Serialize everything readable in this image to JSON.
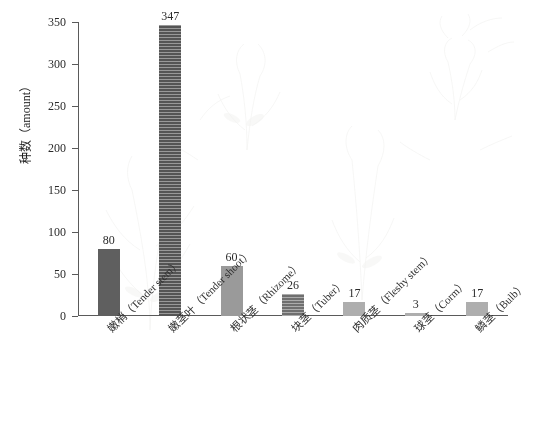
{
  "chart_data": {
    "type": "bar",
    "title": "",
    "subtitle": "",
    "xlabel": "",
    "ylabel": "种数（amount）",
    "ylim": [
      0,
      350
    ],
    "yticks": [
      0,
      50,
      100,
      150,
      200,
      250,
      300,
      350
    ],
    "grid": false,
    "legend": "none",
    "categories": [
      "嫩梢（Tender stem）",
      "嫩茎叶（Tender shoot）",
      "根状茎（Rhizome）",
      "块茎（Tuber）",
      "肉质茎（Fleshy stem）",
      "球茎（Corm）",
      "鳞茎（Bulb）"
    ],
    "values": [
      80,
      347,
      60,
      26,
      17,
      3,
      17
    ],
    "data_labels": [
      "80",
      "347",
      "60",
      "26",
      "17",
      "3",
      "17"
    ],
    "bar_styles": [
      "solid-dark",
      "hatch-dark",
      "solid-mid",
      "hatch-mid",
      "solid-light",
      "solid-light",
      "solid-light"
    ],
    "bar_colors": [
      "#5f5f5f",
      "#555555",
      "#9a9a9a",
      "#6f6f6f",
      "#aeaeae",
      "#aeaeae",
      "#aeaeae"
    ]
  },
  "axis": {
    "y_tick_labels": [
      "0",
      "50",
      "100",
      "150",
      "200",
      "250",
      "300",
      "350"
    ],
    "y_title": "种数（amount）"
  },
  "colors": {
    "axis": "#5a5a5a",
    "text": "#2b2b2b",
    "background": "#ffffff"
  }
}
